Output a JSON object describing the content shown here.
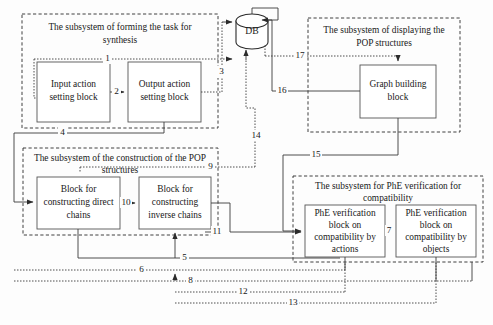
{
  "diagram": {
    "database": {
      "label": "DB"
    },
    "subsystems": [
      {
        "id": "forming",
        "title": "The subsystem of forming the task for synthesis",
        "blocks": [
          {
            "id": "input-action",
            "label": "Input action setting block"
          },
          {
            "id": "output-action",
            "label": "Output action setting block"
          }
        ]
      },
      {
        "id": "construction",
        "title": "The subsystem of the construction of the POP structures",
        "blocks": [
          {
            "id": "direct-chains",
            "label": "Block for constructing direct chains"
          },
          {
            "id": "inverse-chains",
            "label": "Block for constructing inverse chains"
          }
        ]
      },
      {
        "id": "displaying",
        "title": "The subsystem of displaying the POP structures",
        "blocks": [
          {
            "id": "graph-building",
            "label": "Graph building block"
          }
        ]
      },
      {
        "id": "phe-verification",
        "title": "The subsystem for PhE verification for compatibility",
        "blocks": [
          {
            "id": "phe-actions",
            "label": "PhE verification block on compatibility by actions"
          },
          {
            "id": "phe-objects",
            "label": "PhE verification block on compatibility by objects"
          }
        ]
      }
    ],
    "connection_labels": [
      {
        "id": "c1",
        "text": "1"
      },
      {
        "id": "c2",
        "text": "2"
      },
      {
        "id": "c3",
        "text": "3"
      },
      {
        "id": "c4",
        "text": "4"
      },
      {
        "id": "c5",
        "text": "5"
      },
      {
        "id": "c6",
        "text": "6"
      },
      {
        "id": "c7",
        "text": "7"
      },
      {
        "id": "c8",
        "text": "8"
      },
      {
        "id": "c9",
        "text": "9"
      },
      {
        "id": "c10",
        "text": "10"
      },
      {
        "id": "c11",
        "text": "11"
      },
      {
        "id": "c12",
        "text": "12"
      },
      {
        "id": "c13",
        "text": "13"
      },
      {
        "id": "c14",
        "text": "14"
      },
      {
        "id": "c15",
        "text": "15"
      },
      {
        "id": "c16",
        "text": "16"
      },
      {
        "id": "c17",
        "text": "17"
      }
    ],
    "colors": {
      "background": "#fdfdfd",
      "line": "#3a3a3a",
      "dash": "#2b2b2b",
      "block_border": "#555555",
      "text": "#1a1a1a"
    }
  }
}
